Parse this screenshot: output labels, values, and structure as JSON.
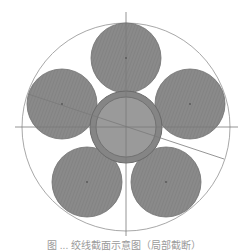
{
  "diagram": {
    "type": "cable-cross-section",
    "canvas": {
      "width": 248,
      "height": 251,
      "background": "#ffffff"
    },
    "center": {
      "x": 126,
      "y": 127
    },
    "enclosing_circle": {
      "r": 104,
      "stroke": "#a8a8a8"
    },
    "axes": {
      "vertical": {
        "x": 126,
        "y1": 12,
        "y2": 236
      },
      "horizontal": {
        "y": 127,
        "x1": 15,
        "x2": 238
      },
      "stroke": "#7a7a7a"
    },
    "diagonal_line": {
      "x1": 28,
      "y1": 94,
      "x2": 224,
      "y2": 159,
      "stroke": "#7a7a7a"
    },
    "core": {
      "outer_r": 36,
      "inner_r": 30,
      "sheath_fill": "#858585",
      "core_fill": "#9a9a9a",
      "stroke": "#6a6a6a"
    },
    "strands": [
      {
        "id": "top",
        "cx": 126,
        "cy": 58,
        "r": 35
      },
      {
        "id": "upper-left",
        "cx": 62,
        "cy": 104,
        "r": 35
      },
      {
        "id": "upper-right",
        "cx": 190,
        "cy": 104,
        "r": 35
      },
      {
        "id": "lower-left",
        "cx": 87,
        "cy": 182,
        "r": 35
      },
      {
        "id": "lower-right",
        "cx": 166,
        "cy": 182,
        "r": 35
      }
    ],
    "strand_fill": "#8a8a8a",
    "strand_stroke": "#6e6e6e",
    "hatch_color": "#7c7c7c"
  },
  "caption": {
    "text": "图 ... 绞线截面示意图（局部截断）"
  }
}
